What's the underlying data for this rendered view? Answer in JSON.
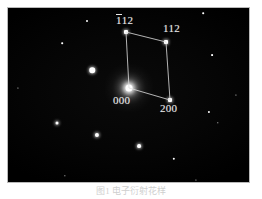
{
  "figure": {
    "type": "electron-diffraction-pattern",
    "caption": "图1 电子衍射花样",
    "plate": {
      "background_color": "#000000",
      "border_color": "#b9b9b9",
      "spot_color": "#ffffff",
      "label_color": "#e8e8e8"
    }
  },
  "indexed_spots": [
    {
      "id": "center",
      "label_prefix": "",
      "label_overbar": "",
      "label_rest": "000",
      "label_full": "000",
      "x": 129,
      "y": 88,
      "size": 7,
      "label_x": 113,
      "label_y": 95
    },
    {
      "id": "minus112",
      "label_prefix": "",
      "label_overbar": "1",
      "label_rest": "12",
      "label_full": "-112",
      "x": 126,
      "y": 32,
      "size": 4,
      "label_x": 116,
      "label_y": 14
    },
    {
      "id": "112",
      "label_prefix": "",
      "label_overbar": "",
      "label_rest": "112",
      "label_full": "112",
      "x": 166,
      "y": 42,
      "size": 4,
      "label_x": 163,
      "label_y": 23
    },
    {
      "id": "200",
      "label_prefix": "",
      "label_overbar": "",
      "label_rest": "200",
      "label_full": "200",
      "x": 170,
      "y": 100,
      "size": 4,
      "label_x": 160,
      "label_y": 103
    }
  ],
  "vectors": [
    {
      "name": "g1",
      "from": "center",
      "to": "minus112"
    },
    {
      "name": "g2",
      "from": "center",
      "to": "200"
    },
    {
      "name": "g1-parallel",
      "from": "minus112",
      "to": "112"
    },
    {
      "name": "g2-parallel",
      "from": "112",
      "to": "200"
    }
  ],
  "background_spots": [
    {
      "x": 87,
      "y": 21,
      "size": 2.0,
      "glow": false
    },
    {
      "x": 62,
      "y": 43,
      "size": 1.6,
      "glow": false
    },
    {
      "x": 203,
      "y": 13,
      "size": 1.6,
      "glow": false
    },
    {
      "x": 212,
      "y": 55,
      "size": 1.8,
      "glow": false
    },
    {
      "x": 92,
      "y": 70,
      "size": 5.5,
      "glow": true
    },
    {
      "x": 57,
      "y": 123,
      "size": 3.0,
      "glow": true
    },
    {
      "x": 97,
      "y": 135,
      "size": 4.2,
      "glow": true
    },
    {
      "x": 139,
      "y": 146,
      "size": 3.8,
      "glow": true
    },
    {
      "x": 209,
      "y": 112,
      "size": 2.2,
      "glow": false
    },
    {
      "x": 174,
      "y": 159,
      "size": 2.4,
      "glow": false
    },
    {
      "x": 218,
      "y": 123,
      "size": 1.4,
      "glow": false
    },
    {
      "x": 65,
      "y": 176,
      "size": 1.3,
      "glow": false
    },
    {
      "x": 236,
      "y": 95,
      "size": 1.2,
      "glow": false
    },
    {
      "x": 18,
      "y": 88,
      "size": 1.1,
      "glow": false
    },
    {
      "x": 196,
      "y": 180,
      "size": 1.1,
      "glow": false
    }
  ]
}
